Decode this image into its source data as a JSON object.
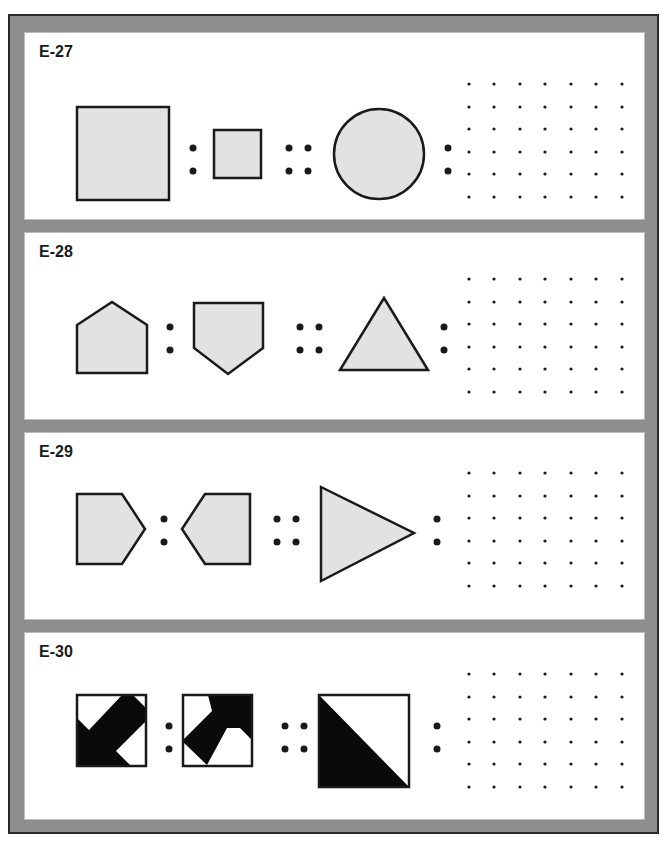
{
  "colors": {
    "frame": "#8e8e8e",
    "frame_border": "#2a2a2a",
    "panel_bg": "#ffffff",
    "shape_fill": "#e2e2e2",
    "stroke": "#1a1a1a",
    "black_fill": "#0a0a0a"
  },
  "problems": [
    {
      "label": "E-27",
      "term_a": "large-square",
      "term_b": "small-square",
      "term_c": "circle",
      "answer_area": "dot-grid-7x6"
    },
    {
      "label": "E-28",
      "term_a": "pentagon-point-up",
      "term_b": "pentagon-point-down",
      "term_c": "triangle-point-up",
      "answer_area": "dot-grid-7x6"
    },
    {
      "label": "E-29",
      "term_a": "pentagon-point-right",
      "term_b": "pentagon-point-left",
      "term_c": "triangle-point-right",
      "answer_area": "dot-grid-7x6"
    },
    {
      "label": "E-30",
      "term_a": "square-black-arrow-pattern",
      "term_b": "square-black-arrow-pattern-rotated",
      "term_c": "square-diagonal-half-black",
      "answer_area": "dot-grid-7x6"
    }
  ],
  "analogy_symbols": {
    "ratio": ":",
    "proportion": "::"
  },
  "dot_grid": {
    "columns": 7,
    "rows": 6
  }
}
